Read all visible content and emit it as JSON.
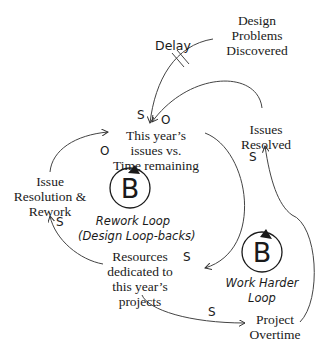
{
  "diagram": {
    "type": "causal-loop-diagram",
    "nodes": [
      {
        "id": "design_problems",
        "lines": [
          "Design",
          "Problems",
          "Discovered"
        ]
      },
      {
        "id": "issues_vs_time",
        "lines": [
          "This year’s",
          "issues vs.",
          "Time remaining"
        ]
      },
      {
        "id": "issues_resolved",
        "lines": [
          "Issues",
          "Resolved"
        ]
      },
      {
        "id": "issue_resolution",
        "lines": [
          "Issue",
          "Resolution &",
          "Rework"
        ]
      },
      {
        "id": "resources",
        "lines": [
          "Resources",
          "dedicated to",
          "this year’s",
          "projects"
        ]
      },
      {
        "id": "overtime",
        "lines": [
          "Project",
          "Overtime"
        ]
      }
    ],
    "edges": [
      {
        "from": "design_problems",
        "to": "issues_vs_time",
        "polarity": "S",
        "delay_label": "Delay"
      },
      {
        "from": "issues_resolved",
        "to": "issues_vs_time",
        "polarity": "O"
      },
      {
        "from": "issue_resolution",
        "to": "issues_vs_time",
        "polarity": "O"
      },
      {
        "from": "issues_vs_time",
        "to": "resources",
        "polarity": "S"
      },
      {
        "from": "resources",
        "to": "issue_resolution",
        "polarity": "S"
      },
      {
        "from": "resources",
        "to": "overtime",
        "polarity": "S"
      },
      {
        "from": "overtime",
        "to": "issues_resolved",
        "polarity": "S"
      }
    ],
    "loops": [
      {
        "id": "rework",
        "symbol": "B",
        "lines": [
          "Rework Loop",
          "(Design Loop-backs)"
        ]
      },
      {
        "id": "work_harder",
        "symbol": "B",
        "lines": [
          "Work Harder",
          "Loop"
        ]
      }
    ]
  }
}
